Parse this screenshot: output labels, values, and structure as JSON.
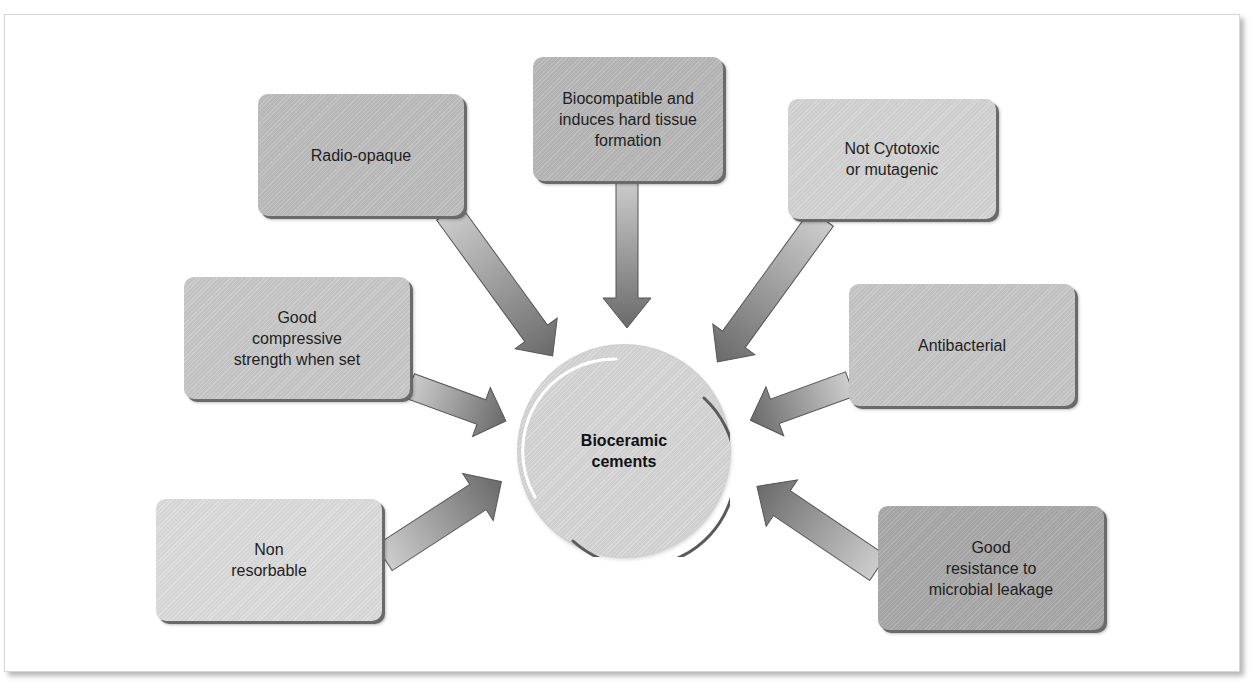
{
  "diagram": {
    "center": {
      "label": "Bioceramic\ncements",
      "color": "#d6d6d6"
    },
    "nodes": [
      {
        "id": "radio-opaque",
        "label": "Radio-opaque",
        "color": "#bdbdbd"
      },
      {
        "id": "biocompatible",
        "label": "Biocompatible and\ninduces hard tissue\nformation",
        "color": "#b8b8b8"
      },
      {
        "id": "not-cytotoxic",
        "label": "Not Cytotoxic\nor mutagenic",
        "color": "#d4d4d4"
      },
      {
        "id": "compressive-strength",
        "label": "Good\ncompressive\nstrength when set",
        "color": "#c8c8c8"
      },
      {
        "id": "antibacterial",
        "label": "Antibacterial",
        "color": "#c6c6c6"
      },
      {
        "id": "non-resorbable",
        "label": "Non\nresorbable",
        "color": "#dcdcdc"
      },
      {
        "id": "microbial-leakage",
        "label": "Good\nresistance to\nmicrobial leakage",
        "color": "#a9a9a9"
      }
    ],
    "arrow_colors": {
      "light": "#c8c8c8",
      "dark": "#6e6e6e"
    }
  }
}
